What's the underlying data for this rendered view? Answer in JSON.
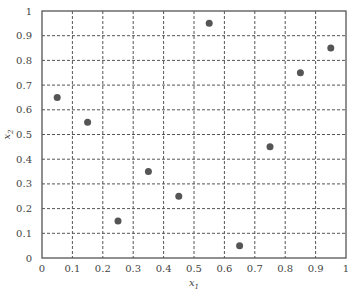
{
  "chart_data": {
    "type": "scatter",
    "title": "",
    "xlabel": "x1",
    "ylabel": "x2",
    "xlim": [
      0,
      1
    ],
    "ylim": [
      0,
      1
    ],
    "grid": true,
    "grid_style": "dashed",
    "legend": null,
    "x_ticks": [
      "0",
      "0.1",
      "0.2",
      "0.3",
      "0.4",
      "0.5",
      "0.6",
      "0.7",
      "0.8",
      "0.9",
      "1"
    ],
    "y_ticks": [
      "0",
      "0.1",
      "0.2",
      "0.3",
      "0.4",
      "0.5",
      "0.6",
      "0.7",
      "0.8",
      "0.9",
      "1"
    ],
    "series": [
      {
        "name": "points",
        "color": "#555555",
        "x": [
          0.05,
          0.15,
          0.25,
          0.35,
          0.45,
          0.55,
          0.65,
          0.75,
          0.85,
          0.95
        ],
        "y": [
          0.65,
          0.55,
          0.15,
          0.35,
          0.25,
          0.95,
          0.05,
          0.45,
          0.75,
          0.85
        ]
      }
    ]
  },
  "labels": {
    "xlabel_main": "x",
    "xlabel_sub": "1",
    "ylabel_main": "x",
    "ylabel_sub": "2"
  }
}
